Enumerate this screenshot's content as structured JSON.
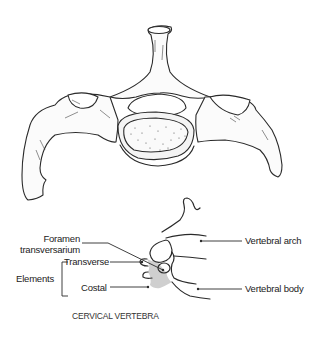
{
  "figure": {
    "top_illustration": "Cervical vertebra superior view (line drawing)",
    "caption": "CERVICAL VERTEBRA"
  },
  "labels": {
    "foramen_line1": "Foramen",
    "foramen_line2": "transversarium",
    "elements": "Elements",
    "transverse": "Transverse",
    "costal": "Costal",
    "vertebral_arch": "Vertebral arch",
    "vertebral_body": "Vertebral body"
  },
  "colors": {
    "ink": "#222222",
    "shading": "#cfcfcf",
    "background": "#ffffff"
  }
}
